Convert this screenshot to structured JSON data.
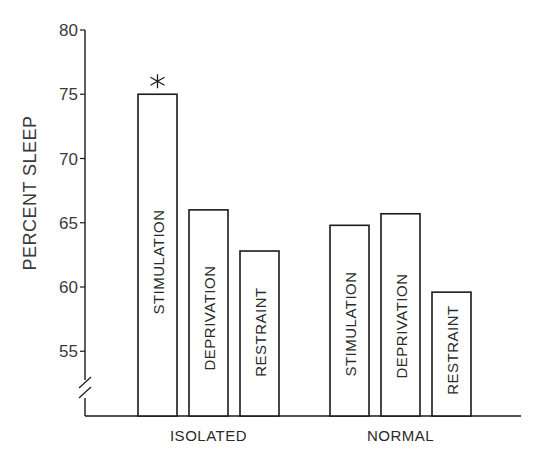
{
  "chart_data": {
    "type": "bar",
    "title": "",
    "xlabel": "",
    "ylabel": "PERCENT SLEEP",
    "ylim": [
      52,
      80
    ],
    "yticks": [
      55,
      60,
      65,
      70,
      75,
      80
    ],
    "axis_break": true,
    "grid": false,
    "legend": null,
    "groups": [
      {
        "name": "ISOLATED",
        "bars": [
          {
            "label": "STIMULATION",
            "value": 75.0,
            "annotation": "*"
          },
          {
            "label": "DEPRIVATION",
            "value": 66.0,
            "annotation": ""
          },
          {
            "label": "RESTRAINT",
            "value": 62.8,
            "annotation": ""
          }
        ]
      },
      {
        "name": "NORMAL",
        "bars": [
          {
            "label": "STIMULATION",
            "value": 64.8,
            "annotation": ""
          },
          {
            "label": "DEPRIVATION",
            "value": 65.7,
            "annotation": ""
          },
          {
            "label": "RESTRAINT",
            "value": 59.6,
            "annotation": ""
          }
        ]
      }
    ],
    "categories": [
      "ISOLATED",
      "NORMAL"
    ],
    "series": [
      {
        "name": "STIMULATION",
        "values": [
          75.0,
          64.8
        ]
      },
      {
        "name": "DEPRIVATION",
        "values": [
          66.0,
          65.7
        ]
      },
      {
        "name": "RESTRAINT",
        "values": [
          62.8,
          59.6
        ]
      }
    ],
    "annotations": [
      {
        "text": "*",
        "target": "ISOLATED STIMULATION",
        "meaning": "significant"
      }
    ]
  },
  "colors": {
    "ink": "#1a1a1a",
    "bar_fill": "#ffffff",
    "background": "#ffffff"
  }
}
